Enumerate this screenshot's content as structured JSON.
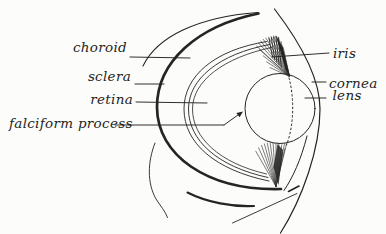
{
  "figure": {
    "type": "anatomical-line-drawing"
  },
  "colors": {
    "ink": "#242424",
    "background": "#fcfcfa"
  },
  "labels": {
    "choroid": "choroid",
    "sclera": "sclera",
    "retina": "retina",
    "falciform_process": "falciform process",
    "iris": "iris",
    "cornea": "cornea",
    "lens": "lens"
  }
}
